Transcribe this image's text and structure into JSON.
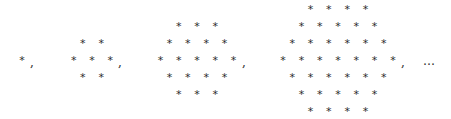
{
  "figure": {
    "glyph": "*",
    "separator": ",",
    "ellipsis": "…",
    "row_spacing_px": 17,
    "col_spacing_px": 18.3,
    "center_y": 61,
    "hexagons": [
      {
        "side": 1,
        "center_x": 22,
        "count": 1,
        "comma_x": 30
      },
      {
        "side": 2,
        "center_x": 92,
        "count": 7,
        "comma_x": 118
      },
      {
        "side": 3,
        "center_x": 197,
        "count": 19,
        "comma_x": 242
      },
      {
        "side": 4,
        "center_x": 338,
        "count": 37,
        "comma_x": 401
      }
    ],
    "ellipsis_x": 423
  }
}
